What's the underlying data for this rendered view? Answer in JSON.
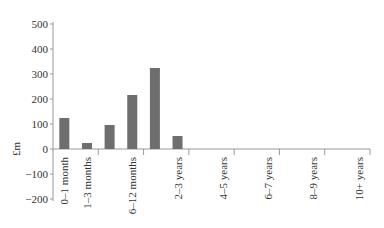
{
  "chart_data": {
    "type": "bar",
    "title": "",
    "xlabel": "",
    "ylabel": "£m",
    "ylim": [
      -200,
      500
    ],
    "yticks": [
      500,
      400,
      300,
      200,
      100,
      0,
      -100,
      -200
    ],
    "grid": false,
    "categories": [
      "0–1 month",
      "1–3 months",
      "3–6 months",
      "6–12 months",
      "1–2 years",
      "2–3 years",
      "3–4 years",
      "4–5 years",
      "5–6 years",
      "6–7 years",
      "7–8 years",
      "8–9 years",
      "9–10 years",
      "10+ years"
    ],
    "visible_tick_labels": [
      "0–1 month",
      "1–3 months",
      "6–12 months",
      "2–3 years",
      "4–5 years",
      "6–7 years",
      "8–9 years",
      "10+ years"
    ],
    "values": [
      124,
      24,
      96,
      216,
      324,
      52,
      0,
      0,
      0,
      0,
      0,
      0,
      0,
      0
    ],
    "bar_color": "#6e6e6e"
  }
}
